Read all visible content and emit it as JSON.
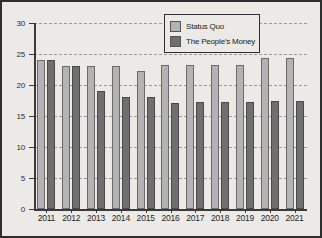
{
  "chart_data": {
    "type": "bar",
    "title": "",
    "xlabel": "",
    "ylabel": "",
    "ylim": [
      0,
      30
    ],
    "yticks": [
      0,
      5,
      10,
      15,
      20,
      25,
      30
    ],
    "grid": true,
    "legend_position": "top-center-right",
    "categories": [
      "2011",
      "2012",
      "2013",
      "2014",
      "2015",
      "2016",
      "2017",
      "2018",
      "2019",
      "2020",
      "2021"
    ],
    "series": [
      {
        "name": "Status Quo",
        "color": "#b3b3b3",
        "values": [
          24.0,
          23.0,
          23.0,
          23.1,
          22.2,
          23.2,
          23.3,
          23.3,
          23.3,
          24.4,
          24.4
        ]
      },
      {
        "name": "The People's Money",
        "color": "#6f6f6f",
        "values": [
          24.0,
          23.0,
          19.1,
          18.0,
          18.0,
          17.1,
          17.2,
          17.2,
          17.3,
          17.4,
          17.5
        ]
      }
    ]
  },
  "legend": {
    "items": [
      {
        "label": "Status Quo",
        "color": "#b3b3b3"
      },
      {
        "label": "The People's Money",
        "color": "#6f6f6f"
      }
    ]
  },
  "axis": {
    "y_labels": [
      "30",
      "25",
      "20",
      "15",
      "10",
      "5",
      "0"
    ],
    "x_labels": [
      "2011",
      "2012",
      "2013",
      "2014",
      "2015",
      "2016",
      "2017",
      "2018",
      "2019",
      "2020",
      "2021"
    ]
  },
  "colors": {
    "background": "#eceae7",
    "frame": "#2e2e2e",
    "axis": "#3a3a3a",
    "grid": "#9a9a9a",
    "series_1": "#b3b3b3",
    "series_2": "#6f6f6f"
  }
}
